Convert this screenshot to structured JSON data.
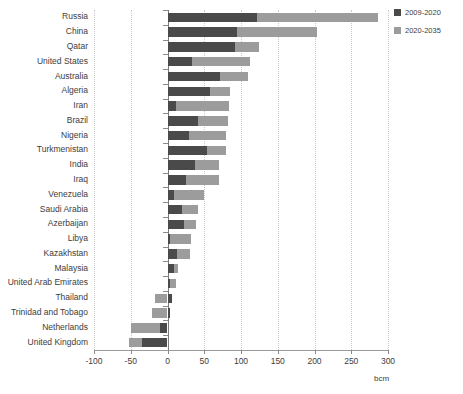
{
  "chart_data": {
    "type": "bar",
    "orientation": "horizontal",
    "stacked": true,
    "title": "",
    "subtitle": "",
    "xlabel": "bcm",
    "ylabel": "",
    "xlim": [
      -100,
      300
    ],
    "xticks": [
      -100,
      -50,
      0,
      50,
      100,
      150,
      200,
      250,
      300
    ],
    "xticklabels": [
      "-100",
      "-50",
      "0",
      "50",
      "100",
      "150",
      "200",
      "250",
      "300"
    ],
    "grid": true,
    "grid_axis": "x",
    "legend_position": "top-right",
    "categories": [
      "Russia",
      "China",
      "Qatar",
      "United States",
      "Australia",
      "Algeria",
      "Iran",
      "Brazil",
      "Nigeria",
      "Turkmenistan",
      "India",
      "Iraq",
      "Venezuela",
      "Saudi Arabia",
      "Azerbaijan",
      "Libya",
      "Kazakhstan",
      "Malaysia",
      "United Arab Emirates",
      "Thailand",
      "Trinidad and Tobago",
      "Netherlands",
      "United Kingdom"
    ],
    "series": [
      {
        "name": "2009-2020",
        "color": "#4a4a4a",
        "values": [
          122,
          94,
          92,
          33,
          72,
          58,
          11,
          42,
          29,
          54,
          38,
          25,
          9,
          20,
          22,
          4,
          13,
          9,
          3,
          6,
          3,
          -10,
          -35
        ]
      },
      {
        "name": "2020-2035",
        "color": "#9c9c9c",
        "values": [
          164,
          110,
          32,
          79,
          38,
          27,
          73,
          40,
          51,
          25,
          32,
          45,
          41,
          21,
          17,
          28,
          17,
          5,
          8,
          -17,
          -21,
          -40,
          -17
        ]
      }
    ],
    "totals": [
      286,
      204,
      124,
      112,
      110,
      85,
      84,
      82,
      80,
      79,
      70,
      70,
      50,
      41,
      39,
      32,
      30,
      14,
      11,
      -11,
      -18,
      -50,
      -52
    ]
  },
  "legend": {
    "items": [
      {
        "label": "2009-2020",
        "color": "#4a4a4a"
      },
      {
        "label": "2020-2035",
        "color": "#9c9c9c"
      }
    ]
  },
  "axis": {
    "unit": "bcm"
  }
}
